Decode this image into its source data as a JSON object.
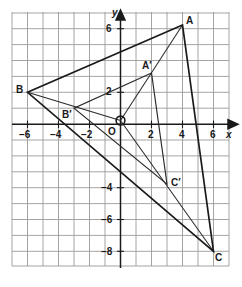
{
  "figure": {
    "type": "coordinate-plane-geometry-diagram",
    "grid": {
      "show": true,
      "x_min": -7,
      "x_max": 7,
      "y_min": -9,
      "y_max": 7,
      "step": 1,
      "color": "#9a9a9a",
      "axis_color": "#1a1a1a"
    },
    "axes": {
      "x_label": "x",
      "y_label": "y",
      "origin_label": "O",
      "x_ticks": [
        {
          "value": -6,
          "label": "−6"
        },
        {
          "value": -4,
          "label": "−4"
        },
        {
          "value": -2,
          "label": "−2"
        },
        {
          "value": 2,
          "label": "2"
        },
        {
          "value": 4,
          "label": "4"
        },
        {
          "value": 6,
          "label": "6"
        }
      ],
      "y_ticks": [
        {
          "value": 6,
          "label": "6"
        },
        {
          "value": 2,
          "label": "2"
        },
        {
          "value": -4,
          "label": "−4"
        },
        {
          "value": -6,
          "label": "−6"
        },
        {
          "value": -8,
          "label": "−8"
        }
      ]
    },
    "points": [
      {
        "name": "A",
        "label": "A",
        "x": 4,
        "y": 6
      },
      {
        "name": "B",
        "label": "B",
        "x": -6,
        "y": 3
      },
      {
        "name": "C",
        "label": "C",
        "x": 6,
        "y": -8
      },
      {
        "name": "A-prime",
        "label": "A′",
        "x": 2,
        "y": 3
      },
      {
        "name": "B-prime",
        "label": "B′",
        "x": -3,
        "y": 1.5
      },
      {
        "name": "C-prime",
        "label": "C′",
        "x": 3,
        "y": -4
      },
      {
        "name": "origin",
        "label": "O",
        "x": 0,
        "y": 0
      }
    ],
    "shapes": [
      {
        "name": "triangle-ABC",
        "vertices": [
          "A",
          "B",
          "C"
        ]
      },
      {
        "name": "triangle-A-prime-B-prime-C-prime",
        "vertices": [
          "A-prime",
          "B-prime",
          "C-prime"
        ]
      }
    ],
    "rays": [
      {
        "name": "ray-O-to-A",
        "from": "origin",
        "to": "A"
      },
      {
        "name": "ray-O-to-B",
        "from": "origin",
        "to": "B"
      },
      {
        "name": "ray-O-to-C",
        "from": "origin",
        "to": "C"
      }
    ],
    "colors": {
      "stroke": "#1a1a1a",
      "grid": "#9a9a9a",
      "background": "#ffffff"
    }
  }
}
